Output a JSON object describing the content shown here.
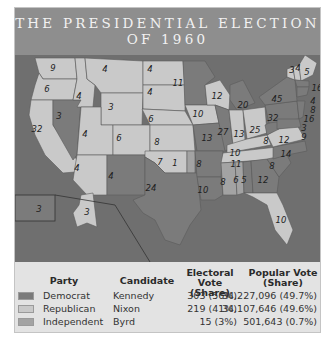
{
  "title": {
    "line1": "THE PRESIDENTIAL ELECTION",
    "line2": "OF 1960"
  },
  "colors": {
    "democrat": "#7b7b7b",
    "republican": "#c9c9c9",
    "independent": "#a3a3a3",
    "background": "#6f6f6f",
    "title_bar": "#8e8e8e"
  },
  "map": {
    "states": [
      {
        "name": "WA",
        "ev": "9",
        "party": "republican"
      },
      {
        "name": "OR",
        "ev": "6",
        "party": "republican"
      },
      {
        "name": "CA",
        "ev": "32",
        "party": "republican"
      },
      {
        "name": "NV",
        "ev": "3",
        "party": "democrat"
      },
      {
        "name": "ID",
        "ev": "4",
        "party": "republican"
      },
      {
        "name": "MT",
        "ev": "4",
        "party": "republican"
      },
      {
        "name": "WY",
        "ev": "3",
        "party": "republican"
      },
      {
        "name": "UT",
        "ev": "4",
        "party": "republican"
      },
      {
        "name": "CO",
        "ev": "6",
        "party": "republican"
      },
      {
        "name": "AZ",
        "ev": "4",
        "party": "republican"
      },
      {
        "name": "NM",
        "ev": "4",
        "party": "democrat"
      },
      {
        "name": "ND",
        "ev": "4",
        "party": "republican"
      },
      {
        "name": "SD",
        "ev": "4",
        "party": "republican"
      },
      {
        "name": "NE",
        "ev": "6",
        "party": "republican"
      },
      {
        "name": "KS",
        "ev": "8",
        "party": "republican"
      },
      {
        "name": "OK",
        "ev": "7",
        "party": "republican"
      },
      {
        "name": "OK-Byrd",
        "ev": "1",
        "party": "independent"
      },
      {
        "name": "TX",
        "ev": "24",
        "party": "democrat"
      },
      {
        "name": "MN",
        "ev": "11",
        "party": "democrat"
      },
      {
        "name": "IA",
        "ev": "10",
        "party": "republican"
      },
      {
        "name": "MO",
        "ev": "13",
        "party": "democrat"
      },
      {
        "name": "AR",
        "ev": "8",
        "party": "democrat"
      },
      {
        "name": "LA",
        "ev": "10",
        "party": "democrat"
      },
      {
        "name": "WI",
        "ev": "12",
        "party": "republican"
      },
      {
        "name": "IL",
        "ev": "27",
        "party": "democrat"
      },
      {
        "name": "MI",
        "ev": "20",
        "party": "democrat"
      },
      {
        "name": "IN",
        "ev": "13",
        "party": "republican"
      },
      {
        "name": "OH",
        "ev": "25",
        "party": "republican"
      },
      {
        "name": "KY",
        "ev": "10",
        "party": "republican"
      },
      {
        "name": "TN",
        "ev": "11",
        "party": "republican"
      },
      {
        "name": "MS",
        "ev": "8",
        "party": "independent"
      },
      {
        "name": "AL-Byrd",
        "ev": "6",
        "party": "independent"
      },
      {
        "name": "AL",
        "ev": "5",
        "party": "democrat"
      },
      {
        "name": "GA",
        "ev": "12",
        "party": "democrat"
      },
      {
        "name": "FL",
        "ev": "10",
        "party": "republican"
      },
      {
        "name": "SC",
        "ev": "8",
        "party": "democrat"
      },
      {
        "name": "NC",
        "ev": "14",
        "party": "democrat"
      },
      {
        "name": "VA",
        "ev": "12",
        "party": "republican"
      },
      {
        "name": "WV",
        "ev": "8",
        "party": "democrat"
      },
      {
        "name": "PA",
        "ev": "32",
        "party": "democrat"
      },
      {
        "name": "NY",
        "ev": "45",
        "party": "democrat"
      },
      {
        "name": "VT",
        "ev": "3",
        "party": "republican"
      },
      {
        "name": "NH",
        "ev": "4",
        "party": "republican"
      },
      {
        "name": "ME",
        "ev": "5",
        "party": "republican"
      },
      {
        "name": "MA",
        "ev": "16",
        "party": "democrat"
      },
      {
        "name": "RI",
        "ev": "4",
        "party": "democrat"
      },
      {
        "name": "CT",
        "ev": "8",
        "party": "democrat"
      },
      {
        "name": "NJ",
        "ev": "16",
        "party": "democrat"
      },
      {
        "name": "DE",
        "ev": "3",
        "party": "democrat"
      },
      {
        "name": "MD",
        "ev": "9",
        "party": "democrat"
      },
      {
        "name": "HI",
        "ev": "3",
        "party": "democrat"
      },
      {
        "name": "AK",
        "ev": "3",
        "party": "republican"
      }
    ]
  },
  "table": {
    "headers": {
      "party": "Party",
      "candidate": "Candidate",
      "electoral_line1": "Electoral Vote",
      "electoral_line2": "(Share)",
      "popular_line1": "Popular Vote",
      "popular_line2": "(Share)"
    },
    "rows": [
      {
        "party": "Democrat",
        "candidate": "Kennedy",
        "electoral": "303 (56%)",
        "popular": "34,227,096 (49.7%)"
      },
      {
        "party": "Republican",
        "candidate": "Nixon",
        "electoral": "219 (41%)",
        "popular": "34,107,646 (49.6%)"
      },
      {
        "party": "Independent",
        "candidate": "Byrd",
        "electoral": "15 (3%)",
        "popular": "501,643 (0.7%)"
      }
    ]
  }
}
